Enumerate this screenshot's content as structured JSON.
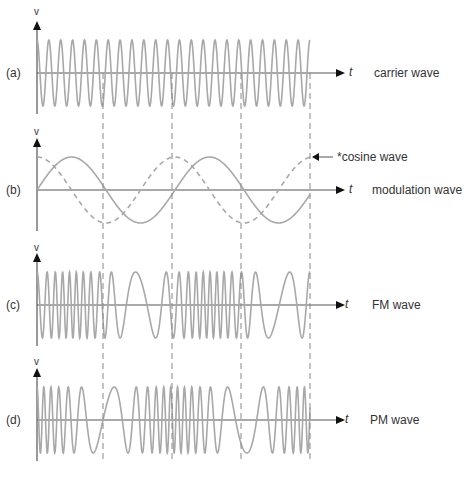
{
  "panels": [
    {
      "id": "a",
      "tag": "(a)",
      "axis_y": 73,
      "name": "carrier wave",
      "v_label": "v",
      "t_label": "t"
    },
    {
      "id": "b",
      "tag": "(b)",
      "axis_y": 190,
      "name": "modulation wave",
      "v_label": "v",
      "t_label": "t"
    },
    {
      "id": "c",
      "tag": "(c)",
      "axis_y": 305,
      "name": "FM wave",
      "v_label": "v",
      "t_label": "t"
    },
    {
      "id": "d",
      "tag": "(d)",
      "axis_y": 420,
      "name": "PM wave",
      "v_label": "v",
      "t_label": "t"
    }
  ],
  "annotation": {
    "text": "*cosine wave"
  },
  "colors": {
    "wave": "#a8a8a8",
    "axis": "#555555",
    "dash": "#888888",
    "arrow": "#111111"
  },
  "geometry": {
    "x0": 37,
    "x1": 310,
    "axis_end": 345,
    "amp": 33,
    "mod_period": 138,
    "dashed_x": [
      103,
      172,
      241,
      310
    ]
  }
}
